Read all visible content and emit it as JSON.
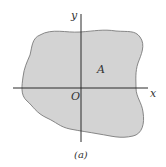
{
  "figure": {
    "caption": "(a)",
    "region_label": "A",
    "origin_label": "O",
    "x_axis_label": "x",
    "y_axis_label": "y",
    "colors": {
      "region_fill": "#d3d3d3",
      "region_stroke": "#7a7a7a",
      "axis": "#2a2a2a",
      "text": "#333333"
    }
  }
}
